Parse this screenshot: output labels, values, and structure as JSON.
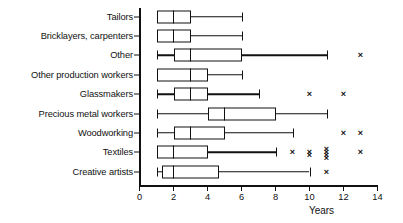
{
  "chart_data": {
    "type": "box",
    "title": "",
    "xlabel": "Years",
    "ylabel": "",
    "xlim": [
      0,
      14
    ],
    "xticks": [
      0,
      2,
      4,
      6,
      8,
      10,
      12,
      14
    ],
    "xticklabels": [
      "0",
      "2",
      "4",
      "6",
      "8",
      "10",
      "12",
      "14"
    ],
    "grid": false,
    "legend": "none",
    "orientation": "horizontal",
    "categories": [
      "Tailors",
      "Bricklayers, carpenters",
      "Other",
      "Other production workers",
      "Glassmakers",
      "Precious metal workers",
      "Woodworking",
      "Textiles",
      "Creative artists"
    ],
    "boxes": [
      {
        "category": "Tailors",
        "whisker_low": 1.0,
        "q1": 1.0,
        "median": 2.0,
        "q3": 3.0,
        "whisker_high": 6.0,
        "outliers": [],
        "left_cap": false,
        "right_cap": true
      },
      {
        "category": "Bricklayers, carpenters",
        "whisker_low": 1.0,
        "q1": 1.0,
        "median": 2.0,
        "q3": 3.0,
        "whisker_high": 6.0,
        "outliers": [],
        "left_cap": false,
        "right_cap": true
      },
      {
        "category": "Other",
        "whisker_low": 1.0,
        "q1": 2.0,
        "median": 3.0,
        "q3": 6.0,
        "whisker_high": 11.0,
        "outliers": [
          13.0
        ],
        "left_cap": true,
        "right_cap": true
      },
      {
        "category": "Other production workers",
        "whisker_low": 1.0,
        "q1": 1.0,
        "median": 3.0,
        "q3": 4.0,
        "whisker_high": 6.0,
        "outliers": [],
        "left_cap": false,
        "right_cap": true
      },
      {
        "category": "Glassmakers",
        "whisker_low": 1.0,
        "q1": 2.0,
        "median": 3.0,
        "q3": 4.0,
        "whisker_high": 7.0,
        "outliers": [
          10.0,
          12.0
        ],
        "left_cap": true,
        "right_cap": true
      },
      {
        "category": "Precious metal workers",
        "whisker_low": 1.0,
        "q1": 4.0,
        "median": 5.0,
        "q3": 8.0,
        "whisker_high": 11.0,
        "outliers": [],
        "left_cap": true,
        "right_cap": true
      },
      {
        "category": "Woodworking",
        "whisker_low": 1.0,
        "q1": 2.0,
        "median": 3.0,
        "q3": 5.0,
        "whisker_high": 9.0,
        "outliers": [
          12.0,
          13.0
        ],
        "left_cap": true,
        "right_cap": true
      },
      {
        "category": "Textiles",
        "whisker_low": 1.0,
        "q1": 1.0,
        "median": 2.0,
        "q3": 4.0,
        "whisker_high": 8.0,
        "outliers": [
          9.0,
          10.0,
          10.0,
          11.0,
          11.0,
          11.0,
          11.0,
          13.0
        ],
        "left_cap": false,
        "right_cap": true
      },
      {
        "category": "Creative artists",
        "whisker_low": 1.0,
        "q1": 1.3,
        "median": 2.0,
        "q3": 4.7,
        "whisker_high": 10.0,
        "outliers": [
          11.0
        ],
        "left_cap": true,
        "right_cap": true
      }
    ],
    "outlier_marker": "×",
    "colors": {
      "line": "#111111",
      "box_fill": "#ffffff"
    }
  }
}
